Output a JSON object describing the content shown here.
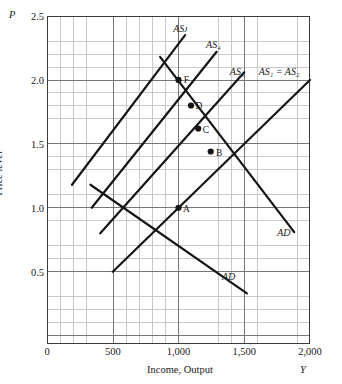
{
  "axes": {
    "y_var": "P",
    "x_var": "Y",
    "y_title": "Price level",
    "x_title": "Income, Output",
    "y_ticks": [
      "2.5",
      "2.0",
      "1.5",
      "1.0",
      "0.5"
    ],
    "y_tick_values": [
      2.5,
      2.0,
      1.5,
      1.0,
      0.5
    ],
    "x_ticks": [
      "0",
      "500",
      "1,000",
      "1,500",
      "2,000"
    ],
    "x_tick_values": [
      0,
      500,
      1000,
      1500,
      2000
    ]
  },
  "chart_data": {
    "type": "line",
    "title": "",
    "xlabel": "Income, Output",
    "ylabel": "Price level",
    "xlim": [
      0,
      2000
    ],
    "ylim": [
      0.0,
      2.5
    ],
    "grid": true,
    "legend": "inline-curve-labels",
    "series": [
      {
        "name": "AD",
        "label": "AD",
        "kind": "aggregate-demand",
        "points": [
          [
            330,
            1.18
          ],
          [
            1520,
            0.33
          ]
        ],
        "label_at": [
          1330,
          0.46
        ]
      },
      {
        "name": "AD'",
        "label": "AD′",
        "kind": "aggregate-demand",
        "points": [
          [
            860,
            2.18
          ],
          [
            1880,
            0.81
          ]
        ],
        "label_at": [
          1750,
          0.8
        ]
      },
      {
        "name": "AS1=AS2",
        "label": "AS₁ = AS₂",
        "kind": "aggregate-supply",
        "points": [
          [
            500,
            0.5
          ],
          [
            2000,
            2.0
          ]
        ],
        "label_at": [
          1610,
          2.06
        ]
      },
      {
        "name": "AS3",
        "label": "AS₃",
        "kind": "aggregate-supply",
        "points": [
          [
            405,
            0.8
          ],
          [
            1500,
            2.06
          ]
        ],
        "label_at": [
          1390,
          2.06
        ]
      },
      {
        "name": "AS4",
        "label": "AS₄",
        "kind": "aggregate-supply",
        "points": [
          [
            340,
            1.0
          ],
          [
            1290,
            2.22
          ]
        ],
        "label_at": [
          1210,
          2.27
        ]
      },
      {
        "name": "ASF",
        "label": "ASᴊ",
        "kind": "aggregate-supply",
        "points": [
          [
            190,
            1.18
          ],
          [
            1050,
            2.35
          ]
        ],
        "label_at": [
          960,
          2.4
        ]
      }
    ],
    "equilibria": [
      {
        "label": "A",
        "x": 1000,
        "y": 1.0,
        "label_at": [
          1035,
          0.98
        ]
      },
      {
        "label": "B",
        "x": 1245,
        "y": 1.44,
        "label_at": [
          1285,
          1.42
        ]
      },
      {
        "label": "C",
        "x": 1150,
        "y": 1.62,
        "label_at": [
          1185,
          1.6
        ]
      },
      {
        "label": "D",
        "x": 1095,
        "y": 1.8,
        "label_at": [
          1130,
          1.79
        ]
      },
      {
        "label": "F",
        "x": 1000,
        "y": 2.0,
        "label_at": [
          1040,
          1.99
        ]
      }
    ]
  },
  "colors": {
    "curve": "#151515",
    "grid_minor": "#c9c9c9",
    "grid_major": "#777777",
    "frame": "#3a3a3a",
    "text": "#1a1a1a"
  }
}
